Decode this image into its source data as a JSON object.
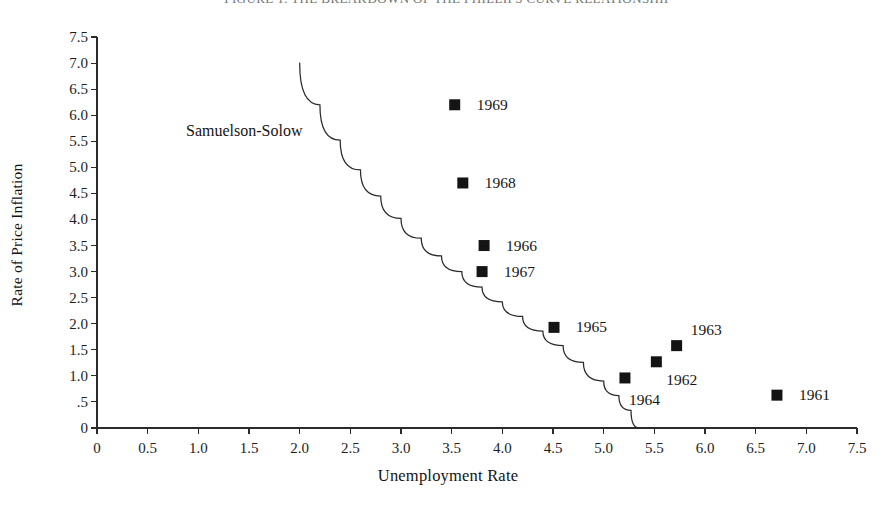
{
  "chart_data": {
    "type": "scatter",
    "title": "FIGURE 1. THE BREAKDOWN OF THE PHILLIPS CURVE RELATIONSHIP",
    "xlabel": "Unemployment Rate",
    "ylabel": "Rate of Price Inflation",
    "xlim": [
      0,
      7.5
    ],
    "ylim": [
      0,
      7.5
    ],
    "grid": false,
    "legend": "none",
    "x_ticks": [
      "0",
      "0.5",
      "1.0",
      "1.5",
      "2.0",
      "2.5",
      "3.0",
      "3.5",
      "4.0",
      "4.5",
      "5.0",
      "5.5",
      "6.0",
      "6.5",
      "7.0",
      "7.5"
    ],
    "x_tick_values": [
      0,
      0.5,
      1.0,
      1.5,
      2.0,
      2.5,
      3.0,
      3.5,
      4.0,
      4.5,
      5.0,
      5.5,
      6.0,
      6.5,
      7.0,
      7.5
    ],
    "y_ticks": [
      "0",
      ".5",
      "1.0",
      "1.5",
      "2.0",
      "2.5",
      "3.0",
      "3.5",
      "4.0",
      "4.5",
      "5.0",
      "5.5",
      "6.0",
      "6.5",
      "7.0",
      "7.5"
    ],
    "y_tick_values": [
      0,
      0.5,
      1.0,
      1.5,
      2.0,
      2.5,
      3.0,
      3.5,
      4.0,
      4.5,
      5.0,
      5.5,
      6.0,
      6.5,
      7.0,
      7.5
    ],
    "marker": "filled-square",
    "marker_color": "#141414",
    "points": [
      {
        "label": "1969",
        "x": 3.53,
        "y": 6.2,
        "label_dx": 22,
        "label_dy": 0
      },
      {
        "label": "1968",
        "x": 3.61,
        "y": 4.7,
        "label_dx": 22,
        "label_dy": 0
      },
      {
        "label": "1966",
        "x": 3.82,
        "y": 3.5,
        "label_dx": 22,
        "label_dy": 0
      },
      {
        "label": "1967",
        "x": 3.8,
        "y": 3.0,
        "label_dx": 22,
        "label_dy": 0
      },
      {
        "label": "1965",
        "x": 4.51,
        "y": 1.93,
        "label_dx": 22,
        "label_dy": 0
      },
      {
        "label": "1963",
        "x": 5.72,
        "y": 1.58,
        "label_dx": 14,
        "label_dy": -16
      },
      {
        "label": "1962",
        "x": 5.52,
        "y": 1.27,
        "label_dx": 10,
        "label_dy": 18
      },
      {
        "label": "1964",
        "x": 5.21,
        "y": 0.96,
        "label_dx": 4,
        "label_dy": 22
      },
      {
        "label": "1961",
        "x": 6.71,
        "y": 0.63,
        "label_dx": 22,
        "label_dy": 0
      }
    ],
    "annotations": [
      {
        "text": "Samuelson-Solow",
        "x": 0.88,
        "y": 5.88
      }
    ],
    "curve": {
      "name": "Samuelson-Solow",
      "color": "#2b2b2b",
      "x_start": 2.0,
      "y_start": 7.0,
      "x_end": 5.35,
      "y_end": 0.0,
      "points": [
        [
          2.0,
          7.0
        ],
        [
          2.2,
          6.2
        ],
        [
          2.4,
          5.52
        ],
        [
          2.6,
          4.95
        ],
        [
          2.8,
          4.45
        ],
        [
          3.0,
          4.02
        ],
        [
          3.2,
          3.64
        ],
        [
          3.4,
          3.3
        ],
        [
          3.6,
          3.0
        ],
        [
          3.8,
          2.7
        ],
        [
          4.0,
          2.42
        ],
        [
          4.2,
          2.14
        ],
        [
          4.4,
          1.86
        ],
        [
          4.6,
          1.58
        ],
        [
          4.8,
          1.26
        ],
        [
          5.0,
          0.9
        ],
        [
          5.15,
          0.62
        ],
        [
          5.27,
          0.34
        ],
        [
          5.35,
          0.0
        ]
      ]
    }
  },
  "axis_titles": {
    "x": "Unemployment Rate",
    "y": "Rate of Price Inflation"
  },
  "curve_annotation": {
    "text": "Samuelson-Solow"
  },
  "page_title": {
    "text": "FIGURE 1. THE BREAKDOWN OF THE PHILLIPS CURVE RELATIONSHIP"
  }
}
